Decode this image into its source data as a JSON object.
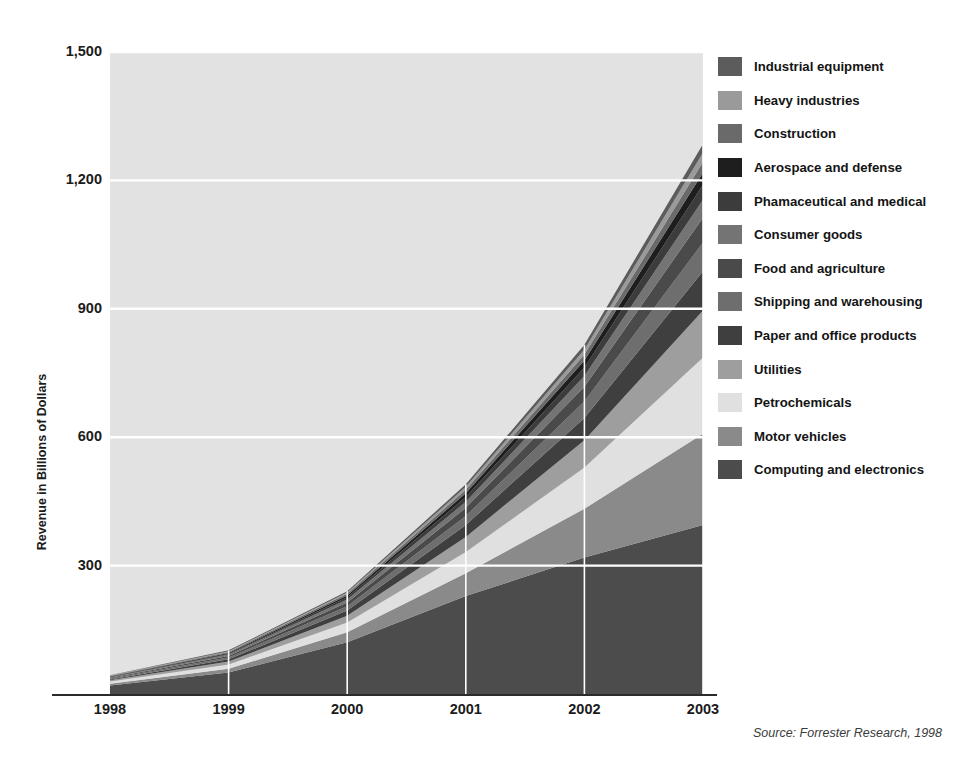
{
  "figure": {
    "title": "FIGURE 1.1  U.S. BUSINESS-TO-BUSINESS INTERNET COMMERCE REVENUE BY INDUSTRY",
    "source_note": "Source: Forrester Research, 1998"
  },
  "chart_data": {
    "type": "area",
    "title": "FIGURE 1.1  U.S. BUSINESS-TO-BUSINESS INTERNET COMMERCE REVENUE BY INDUSTRY",
    "xlabel": "",
    "ylabel": "Revenue in Billions of Dollars",
    "x": [
      "1998",
      "1999",
      "2000",
      "2001",
      "2002",
      "2003"
    ],
    "xtick_labels": [
      "1998",
      "1999",
      "2000",
      "2001",
      "2002",
      "2003"
    ],
    "ytick_labels": [
      "300",
      "600",
      "900",
      "1,200",
      "1,500"
    ],
    "yticks": [
      300,
      600,
      900,
      1200,
      1500
    ],
    "ylim": [
      0,
      1500
    ],
    "grid": "horizontal-white-and-vertical-white",
    "legend_position": "right",
    "stack_order_bottom_to_top": [
      "Computing and electronics",
      "Motor vehicles",
      "Petrochemicals",
      "Utilities",
      "Paper and office products",
      "Shipping and warehousing",
      "Food and agriculture",
      "Consumer goods",
      "Phamaceutical and medical",
      "Aerospace and defense",
      "Construction",
      "Heavy industries",
      "Industrial equipment"
    ],
    "series": [
      {
        "name": "Computing and electronics",
        "color": "#4c4c4c",
        "values": [
          20,
          50,
          121,
          229,
          319,
          395
        ]
      },
      {
        "name": "Motor vehicles",
        "color": "#8a8a8a",
        "values": [
          4,
          9,
          23,
          53,
          114,
          213
        ]
      },
      {
        "name": "Petrochemicals",
        "color": "#e0e0e0",
        "values": [
          5,
          10,
          23,
          50,
          96,
          178
        ]
      },
      {
        "name": "Utilities",
        "color": "#9e9e9e",
        "values": [
          3,
          7,
          16,
          35,
          64,
          110
        ]
      },
      {
        "name": "Paper and office products",
        "color": "#3f3f3f",
        "values": [
          2,
          5,
          12,
          28,
          52,
          92
        ]
      },
      {
        "name": "Shipping and warehousing",
        "color": "#6e6e6e",
        "values": [
          2,
          4,
          10,
          21,
          39,
          67
        ]
      },
      {
        "name": "Food and agriculture",
        "color": "#4a4a4a",
        "values": [
          2,
          4,
          9,
          19,
          34,
          58
        ]
      },
      {
        "name": "Consumer goods",
        "color": "#747474",
        "values": [
          1,
          3,
          7,
          14,
          25,
          42
        ]
      },
      {
        "name": "Phamaceutical and medical",
        "color": "#3c3c3c",
        "values": [
          1,
          2,
          5,
          11,
          20,
          35
        ]
      },
      {
        "name": "Aerospace and defense",
        "color": "#1e1e1e",
        "values": [
          1,
          2,
          4,
          9,
          16,
          28
        ]
      },
      {
        "name": "Construction",
        "color": "#6a6a6a",
        "values": [
          1,
          2,
          4,
          8,
          14,
          25
        ]
      },
      {
        "name": "Heavy industries",
        "color": "#9a9a9a",
        "values": [
          1,
          2,
          3,
          7,
          12,
          22
        ]
      },
      {
        "name": "Industrial equipment",
        "color": "#5c5c5c",
        "values": [
          1,
          2,
          3,
          6,
          11,
          20
        ]
      }
    ],
    "totals": [
      44,
      102,
      240,
      490,
      816,
      1285
    ],
    "plot_background": "#e2e2e2"
  },
  "legend": {
    "items": [
      {
        "label": "Industrial equipment",
        "color": "#5c5c5c"
      },
      {
        "label": "Heavy industries",
        "color": "#9a9a9a"
      },
      {
        "label": "Construction",
        "color": "#6a6a6a"
      },
      {
        "label": "Aerospace and defense",
        "color": "#1e1e1e"
      },
      {
        "label": "Phamaceutical and medical",
        "color": "#3c3c3c"
      },
      {
        "label": "Consumer goods",
        "color": "#747474"
      },
      {
        "label": "Food and agriculture",
        "color": "#4a4a4a"
      },
      {
        "label": "Shipping and warehousing",
        "color": "#6e6e6e"
      },
      {
        "label": "Paper and office products",
        "color": "#3f3f3f"
      },
      {
        "label": "Utilities",
        "color": "#9e9e9e"
      },
      {
        "label": "Petrochemicals",
        "color": "#e0e0e0"
      },
      {
        "label": "Motor vehicles",
        "color": "#8a8a8a"
      },
      {
        "label": "Computing and electronics",
        "color": "#4c4c4c"
      }
    ]
  }
}
